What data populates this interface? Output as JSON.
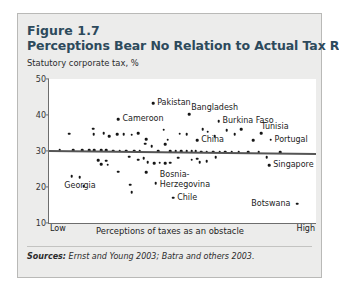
{
  "figure": {
    "number": "Figure 1.7",
    "title": "Perceptions Bear No Relation to Actual Tax Rates",
    "subtitle": "Statutory corporate tax, %",
    "sources_prefix": "Sources:",
    "sources_text": " Ernst and Young 2003; Batra and others 2003."
  },
  "chart_data": {
    "type": "scatter",
    "title": "Perceptions Bear No Relation to Actual Tax Rates",
    "subtitle": "Statutory corporate tax, %",
    "xlabel": "Perceptions of taxes as an obstacle",
    "ylabel": "Statutory corporate tax, %",
    "xlim": [
      0,
      100
    ],
    "ylim": [
      10,
      50
    ],
    "yticks": [
      50,
      40,
      30,
      20,
      10
    ],
    "xtick_labels": [
      "Low",
      "High"
    ],
    "grid": false,
    "legend": false,
    "trendline": {
      "type": "linear",
      "x_start": 0,
      "y_start": 30.4,
      "x_end": 100,
      "y_end": 29.6
    },
    "labeled_points": [
      {
        "label": "Pakistan",
        "x": 39.0,
        "y": 43.2,
        "label_dx": 4,
        "label_dy": 0
      },
      {
        "label": "Bangladesh",
        "x": 52.5,
        "y": 40.3,
        "label_dx": 2,
        "label_dy": -6
      },
      {
        "label": "Burkina Faso",
        "x": 63.5,
        "y": 38.3,
        "label_dx": 4,
        "label_dy": 0
      },
      {
        "label": "Cameroon",
        "x": 26.0,
        "y": 38.8,
        "label_dx": 4,
        "label_dy": 0
      },
      {
        "label": "Tunisia",
        "x": 79.5,
        "y": 35.0,
        "label_dx": 0,
        "label_dy": -6
      },
      {
        "label": "Portugal",
        "x": 83.0,
        "y": 33.1,
        "label_dx": 4,
        "label_dy": 0
      },
      {
        "label": "China",
        "x": 55.5,
        "y": 33.0,
        "label_dx": 4,
        "label_dy": 0
      },
      {
        "label": "Singapore",
        "x": 82.5,
        "y": 26.0,
        "label_dx": 4,
        "label_dy": 0
      },
      {
        "label": "Georgia",
        "x": 5.0,
        "y": 20.2,
        "label_dx": 2,
        "label_dy": 0
      },
      {
        "label": "Bosnia-Herzegovina",
        "x": 40.0,
        "y": 21.0,
        "label_dx": 4,
        "label_dy": 0
      },
      {
        "label": "Chile",
        "x": 46.5,
        "y": 17.0,
        "label_dx": 4,
        "label_dy": 0
      },
      {
        "label": "Botswana",
        "x": 93.0,
        "y": 15.4,
        "label_dx": -46,
        "label_dy": 0
      }
    ],
    "points": [
      {
        "x": 39.0,
        "y": 43.2
      },
      {
        "x": 52.5,
        "y": 40.3
      },
      {
        "x": 63.5,
        "y": 38.3
      },
      {
        "x": 26.0,
        "y": 38.8
      },
      {
        "x": 79.5,
        "y": 35.0
      },
      {
        "x": 83.0,
        "y": 33.1
      },
      {
        "x": 55.5,
        "y": 33.0
      },
      {
        "x": 82.5,
        "y": 26.0
      },
      {
        "x": 40.0,
        "y": 21.0
      },
      {
        "x": 46.5,
        "y": 17.0
      },
      {
        "x": 93.0,
        "y": 15.4
      },
      {
        "x": 7.5,
        "y": 34.8
      },
      {
        "x": 16.5,
        "y": 36.2
      },
      {
        "x": 16.8,
        "y": 34.6
      },
      {
        "x": 20.5,
        "y": 34.9
      },
      {
        "x": 22.5,
        "y": 34.1
      },
      {
        "x": 25.5,
        "y": 34.6
      },
      {
        "x": 28.0,
        "y": 34.7
      },
      {
        "x": 31.0,
        "y": 34.5
      },
      {
        "x": 33.5,
        "y": 34.9
      },
      {
        "x": 36.5,
        "y": 33.3
      },
      {
        "x": 43.0,
        "y": 35.9
      },
      {
        "x": 44.5,
        "y": 33.1
      },
      {
        "x": 49.0,
        "y": 34.8
      },
      {
        "x": 51.5,
        "y": 34.7
      },
      {
        "x": 57.5,
        "y": 36.0
      },
      {
        "x": 59.5,
        "y": 35.4
      },
      {
        "x": 62.0,
        "y": 34.1
      },
      {
        "x": 66.5,
        "y": 35.7
      },
      {
        "x": 69.5,
        "y": 34.6
      },
      {
        "x": 72.0,
        "y": 36.1
      },
      {
        "x": 76.5,
        "y": 33.0
      },
      {
        "x": 4.0,
        "y": 30.3
      },
      {
        "x": 9.0,
        "y": 30.3
      },
      {
        "x": 12.5,
        "y": 30.3
      },
      {
        "x": 15.0,
        "y": 30.2
      },
      {
        "x": 17.0,
        "y": 30.2
      },
      {
        "x": 19.5,
        "y": 30.2
      },
      {
        "x": 21.5,
        "y": 30.2
      },
      {
        "x": 24.0,
        "y": 30.1
      },
      {
        "x": 26.5,
        "y": 30.1
      },
      {
        "x": 29.0,
        "y": 30.1
      },
      {
        "x": 32.0,
        "y": 30.1
      },
      {
        "x": 34.0,
        "y": 30.0
      },
      {
        "x": 36.0,
        "y": 32.0
      },
      {
        "x": 38.5,
        "y": 31.4
      },
      {
        "x": 41.0,
        "y": 30.0
      },
      {
        "x": 43.5,
        "y": 31.9
      },
      {
        "x": 45.5,
        "y": 30.0
      },
      {
        "x": 47.5,
        "y": 29.9
      },
      {
        "x": 49.5,
        "y": 29.9
      },
      {
        "x": 51.5,
        "y": 29.9
      },
      {
        "x": 53.5,
        "y": 29.9
      },
      {
        "x": 55.0,
        "y": 29.9
      },
      {
        "x": 57.0,
        "y": 29.8
      },
      {
        "x": 59.0,
        "y": 29.8
      },
      {
        "x": 61.5,
        "y": 29.8
      },
      {
        "x": 64.0,
        "y": 29.8
      },
      {
        "x": 66.0,
        "y": 29.8
      },
      {
        "x": 68.5,
        "y": 29.7
      },
      {
        "x": 71.0,
        "y": 29.7
      },
      {
        "x": 74.5,
        "y": 29.7
      },
      {
        "x": 78.5,
        "y": 29.6
      },
      {
        "x": 81.5,
        "y": 28.3
      },
      {
        "x": 86.5,
        "y": 29.6
      },
      {
        "x": 18.5,
        "y": 27.5
      },
      {
        "x": 19.5,
        "y": 26.4
      },
      {
        "x": 21.5,
        "y": 27.3
      },
      {
        "x": 22.0,
        "y": 26.2
      },
      {
        "x": 33.5,
        "y": 27.6
      },
      {
        "x": 37.0,
        "y": 26.9
      },
      {
        "x": 39.5,
        "y": 26.6
      },
      {
        "x": 41.5,
        "y": 26.7
      },
      {
        "x": 43.5,
        "y": 26.6
      },
      {
        "x": 45.5,
        "y": 26.8
      },
      {
        "x": 53.5,
        "y": 27.6
      },
      {
        "x": 55.5,
        "y": 27.9
      },
      {
        "x": 56.5,
        "y": 26.9
      },
      {
        "x": 59.0,
        "y": 27.2
      },
      {
        "x": 30.0,
        "y": 28.4
      },
      {
        "x": 35.5,
        "y": 28.0
      },
      {
        "x": 48.5,
        "y": 28.1
      },
      {
        "x": 62.5,
        "y": 28.2
      },
      {
        "x": 26.0,
        "y": 24.2
      },
      {
        "x": 36.5,
        "y": 24.1
      },
      {
        "x": 13.0,
        "y": 20.3
      },
      {
        "x": 30.5,
        "y": 20.6
      },
      {
        "x": 31.0,
        "y": 18.6
      },
      {
        "x": 8.5,
        "y": 23.0
      },
      {
        "x": 11.5,
        "y": 22.8
      }
    ]
  }
}
